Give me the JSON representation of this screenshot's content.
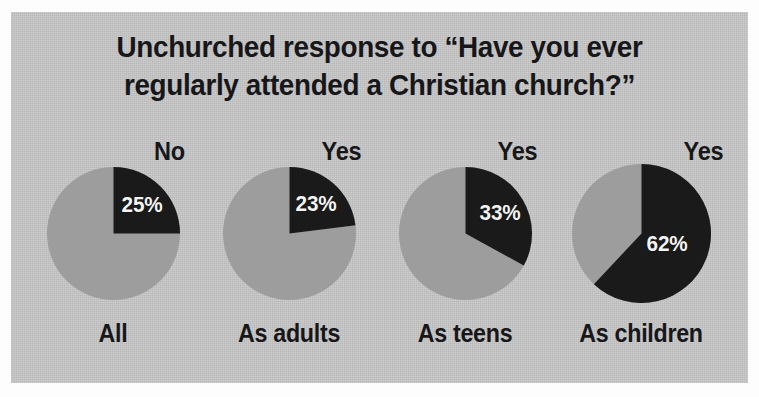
{
  "figure": {
    "title_lines": [
      "Unchurched response to “Have you ever",
      "regularly attended a Christian church?”"
    ],
    "panel_color": "#c8c8c8",
    "slice_color": "#1a1a1a",
    "remainder_color": "#9d9d9d",
    "text_color": "#17171a",
    "value_text_color": "#f4f4f4"
  },
  "chart_data": {
    "type": "pie",
    "title": "Unchurched response to “Have you ever regularly attended a Christian church?”",
    "xlabel": "",
    "ylabel": "",
    "legend": [],
    "grid": false,
    "note": "Four separate pie charts; the dark slice is the highlighted response, drawn clockwise from 12 o'clock.",
    "charts": [
      {
        "category": "All",
        "slice_label": "No",
        "value": 25,
        "value_text": "25%",
        "remainder": 75,
        "highlight_color": "#1a1a1a",
        "remainder_color": "#9d9d9d"
      },
      {
        "category": "As adults",
        "slice_label": "Yes",
        "value": 23,
        "value_text": "23%",
        "remainder": 77,
        "highlight_color": "#1a1a1a",
        "remainder_color": "#9d9d9d"
      },
      {
        "category": "As teens",
        "slice_label": "Yes",
        "value": 33,
        "value_text": "33%",
        "remainder": 67,
        "highlight_color": "#1a1a1a",
        "remainder_color": "#9d9d9d"
      },
      {
        "category": "As children",
        "slice_label": "Yes",
        "value": 62,
        "value_text": "62%",
        "remainder": 38,
        "highlight_color": "#1a1a1a",
        "remainder_color": "#9d9d9d"
      }
    ]
  }
}
